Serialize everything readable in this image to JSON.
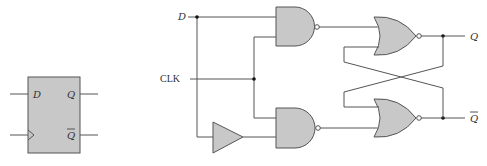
{
  "diagram": {
    "type": "circuit",
    "title": "",
    "block_symbol": {
      "name": "D flip-flop",
      "inputs": [
        {
          "label": "D"
        },
        {
          "label": "",
          "symbol": "clock-triangle"
        }
      ],
      "outputs": [
        {
          "label": "Q"
        },
        {
          "label": "Q",
          "overbar": true
        }
      ]
    },
    "schematic": {
      "inputs": {
        "d": "D",
        "clk": "CLK"
      },
      "outputs": {
        "q": "Q",
        "qbar": "Q"
      },
      "components": [
        {
          "id": "nand-top",
          "type": "NAND",
          "inputs": [
            "D",
            "CLK"
          ]
        },
        {
          "id": "buffer",
          "type": "buffer",
          "inputs": [
            "D"
          ]
        },
        {
          "id": "nand-bottom",
          "type": "NAND",
          "inputs": [
            "CLK",
            "buffer"
          ]
        },
        {
          "id": "nor-top",
          "type": "NOR",
          "inputs": [
            "nand-top",
            "nor-bottom"
          ],
          "output": "Q"
        },
        {
          "id": "nor-bottom",
          "type": "NOR",
          "inputs": [
            "nor-top",
            "nand-bottom"
          ],
          "output": "Q-bar"
        }
      ]
    },
    "colors": {
      "gate_fill": "#c8c8c8",
      "wire": "#555555",
      "block_fill": "#c8c8c8"
    }
  }
}
